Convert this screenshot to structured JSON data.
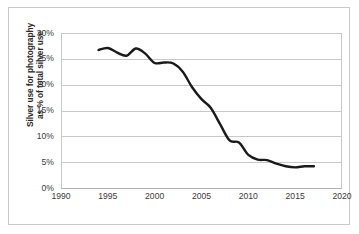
{
  "chart_data": {
    "type": "line",
    "title": "",
    "xlabel": "",
    "ylabel": "Silver use for photography as % of total silver use",
    "ylabel_line1": "Silver use for photography",
    "ylabel_line2": "as % of total silver use",
    "xlim": [
      1990,
      2020
    ],
    "ylim": [
      0,
      30
    ],
    "x_ticks": [
      1990,
      1995,
      2000,
      2005,
      2010,
      2015,
      2020
    ],
    "x_tick_labels": [
      "1990",
      "1995",
      "2000",
      "2005",
      "2010",
      "2015",
      "2020"
    ],
    "y_ticks": [
      0,
      5,
      10,
      15,
      20,
      25,
      30
    ],
    "y_tick_labels": [
      "0%",
      "5%",
      "10%",
      "15%",
      "20%",
      "25%",
      "30%"
    ],
    "grid": "horizontal",
    "legend": "none",
    "line_color": "#1a1a1a",
    "line_width": 2.4,
    "gridline_color": "#c9c9c9",
    "series": [
      {
        "name": "Silver use for photography as % of total silver use",
        "x": [
          1994,
          1995,
          1996,
          1997,
          1998,
          1999,
          2000,
          2001,
          2002,
          2003,
          2004,
          2005,
          2006,
          2007,
          2008,
          2009,
          2010,
          2011,
          2012,
          2013,
          2014,
          2015,
          2016,
          2017
        ],
        "values": [
          26.7,
          27.1,
          26.2,
          25.6,
          27.0,
          26.0,
          24.2,
          24.3,
          24.1,
          22.5,
          19.5,
          17.2,
          15.5,
          12.3,
          9.2,
          8.8,
          6.4,
          5.5,
          5.4,
          4.7,
          4.2,
          4.0,
          4.2,
          4.2
        ]
      }
    ]
  }
}
